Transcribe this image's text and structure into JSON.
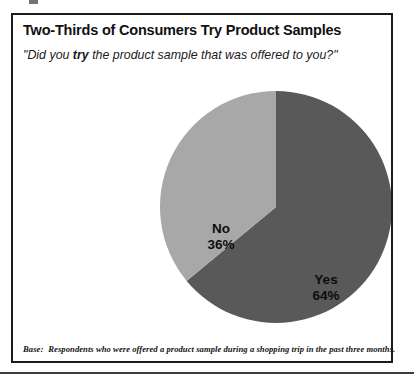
{
  "figure": {
    "title": "Two-Thirds of Consumers Try Product Samples",
    "question_prefix": "\"Did you ",
    "question_emphasis": "try",
    "question_suffix": " the product sample that was offered to you?\"",
    "base_label": "Base:",
    "base_text": "Respondents who were offered a product sample during a shopping trip in the past three months."
  },
  "chart_data": {
    "type": "pie",
    "title": "Two-Thirds of Consumers Try Product Samples",
    "subtitle": "\"Did you try the product sample that was offered to you?\"",
    "categories": [
      "Yes",
      "No"
    ],
    "values": [
      64,
      36
    ],
    "value_labels": [
      "64%",
      "36%"
    ],
    "units": "percent",
    "slices": [
      {
        "name": "Yes",
        "value": 64,
        "value_label": "64%",
        "color": "#595959",
        "start_angle_deg": 0,
        "end_angle_deg": 230.4
      },
      {
        "name": "No",
        "value": 36,
        "value_label": "36%",
        "color": "#a8a8a8",
        "start_angle_deg": 230.4,
        "end_angle_deg": 360
      }
    ],
    "legend": "none",
    "grid": false,
    "start_angle_note": "first slice begins at 12 o'clock, drawn clockwise",
    "geometry": {
      "center_x": 274,
      "center_y": 205,
      "radius": 116
    }
  },
  "colors": {
    "yes_slice": "#595959",
    "no_slice": "#a8a8a8",
    "border": "#1c1c1c",
    "text": "#111111",
    "background": "#ffffff",
    "page_rule": "#3d3d3d"
  }
}
